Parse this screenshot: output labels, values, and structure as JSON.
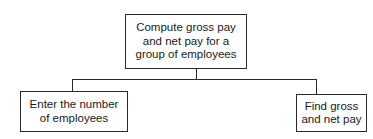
{
  "diagram": {
    "type": "hierarchy-chart",
    "root": {
      "label": "Compute gross pay\nand net pay for a\ngroup of employees"
    },
    "children": [
      {
        "label": "Enter the number\nof employees"
      },
      {
        "label": "Find gross\nand net pay"
      }
    ],
    "colors": {
      "line": "#2a2a2a",
      "background": "#ffffff",
      "text": "#1a1a1a"
    }
  }
}
